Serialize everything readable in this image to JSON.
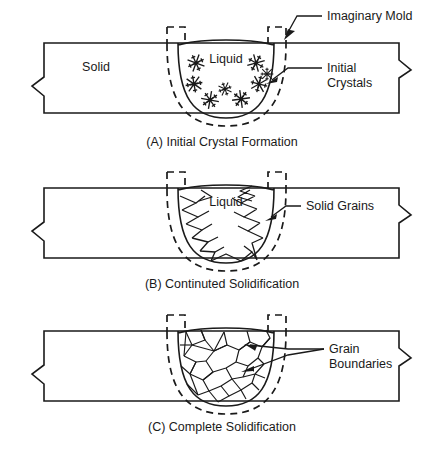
{
  "figure": {
    "panels": [
      {
        "id": "A",
        "caption": "(A) Initial Crystal Formation",
        "inner_labels": {
          "solid": "Solid",
          "liquid": "Liquid"
        },
        "callouts": [
          {
            "name": "imaginary-mold",
            "text": "Imaginary Mold",
            "lines": [
              "Imaginary Mold"
            ]
          },
          {
            "name": "initial-crystals",
            "text": "Initial Crystals",
            "lines": [
              "Initial",
              "Crystals"
            ]
          }
        ],
        "crystal_count": 8
      },
      {
        "id": "B",
        "caption": "(B) Continuted Solidification",
        "inner_labels": {
          "liquid": "Liquid"
        },
        "callouts": [
          {
            "name": "solid-grains",
            "text": "Solid Grains",
            "lines": [
              "Solid Grains"
            ]
          }
        ],
        "spike_count": 22
      },
      {
        "id": "C",
        "caption": "(C) Complete Solidification",
        "inner_labels": {},
        "callouts": [
          {
            "name": "grain-boundaries",
            "text": "Grain Boundaries",
            "lines": [
              "Grain",
              "Boundaries"
            ]
          }
        ]
      }
    ],
    "colors": {
      "line": "#1a1a1a",
      "background": "#ffffff"
    }
  }
}
